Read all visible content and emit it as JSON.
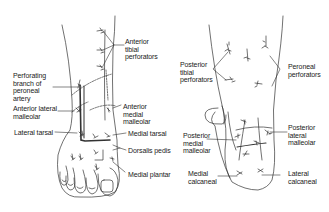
{
  "figure": {
    "left_view": {
      "name": "Anterior (dorsal) view of foot",
      "labels": {
        "anterior_tibial_perforators": "Anterior\ntibial\nperforators",
        "perforating_branch_peroneal": "Perforating\nbranch of\nperoneal\nartery",
        "anterior_lateral_malleolar": "Anterior lateral\nmalleolar",
        "anterior_medial_malleolar": "Anterior\nmedial\nmalleolar",
        "lateral_tarsal": "Lateral tarsal",
        "medial_tarsal": "Medial tarsal",
        "dorsalis_pedis": "Dorsalis pedis",
        "medial_plantar": "Medial plantar"
      }
    },
    "right_view": {
      "name": "Posterior view of foot",
      "labels": {
        "posterior_tibial_perforators": "Posterior\ntibial\nperforators",
        "peroneal_perforators": "Peroneal\nperforators",
        "posterior_medial_malleolar": "Posterior\nmedial\nmalleolar",
        "posterior_lateral_malleolar": "Posterior\nlateral\nmalleolar",
        "medial_calcaneal": "Medial\ncalcaneal",
        "lateral_calcaneal": "Lateral\ncalcaneal"
      }
    },
    "colors": {
      "line": "#333333",
      "text": "#222222",
      "background": "#ffffff"
    }
  }
}
